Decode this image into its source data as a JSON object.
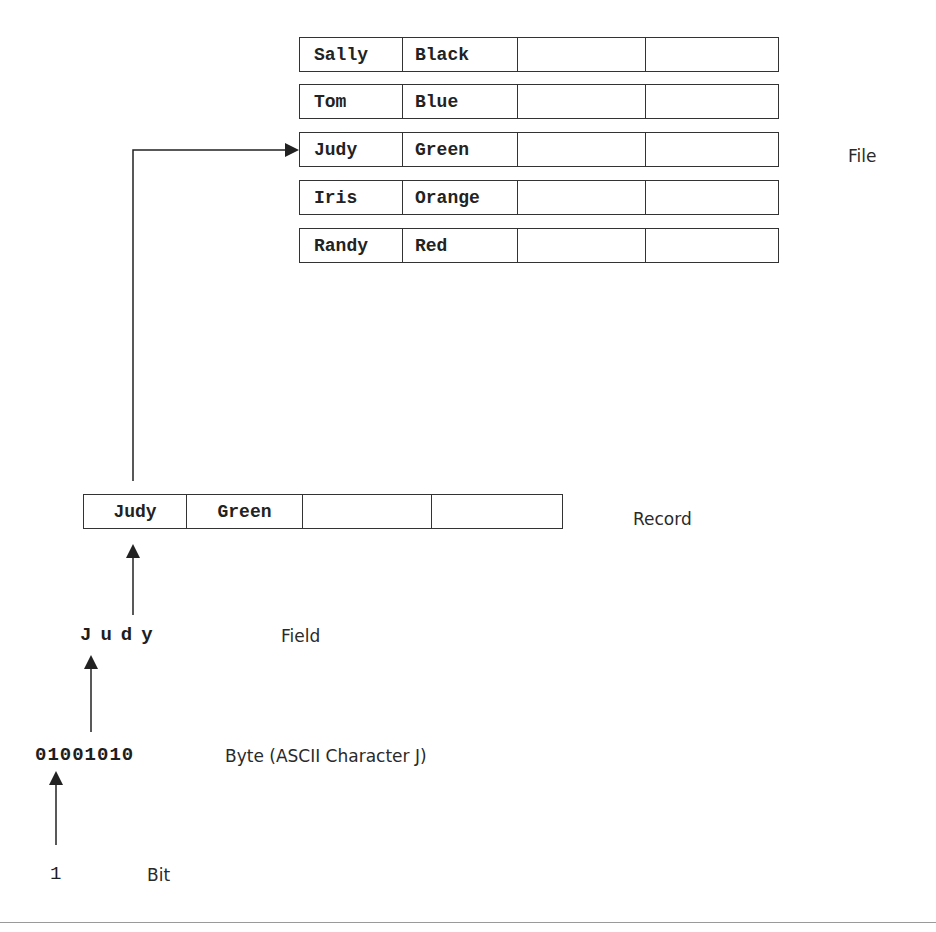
{
  "diagram": {
    "levels": {
      "file": {
        "label": "File",
        "records": [
          {
            "name": "Sally",
            "color": "Black"
          },
          {
            "name": "Tom",
            "color": "Blue"
          },
          {
            "name": "Judy",
            "color": "Green"
          },
          {
            "name": "Iris",
            "color": "Orange"
          },
          {
            "name": "Randy",
            "color": "Red"
          }
        ]
      },
      "record": {
        "label": "Record",
        "fields": [
          "Judy",
          "Green",
          "",
          ""
        ]
      },
      "field": {
        "label": "Field",
        "value": "Judy"
      },
      "byte": {
        "label": "Byte (ASCII Character J)",
        "value": "01001010"
      },
      "bit": {
        "label": "Bit",
        "value": "1"
      }
    },
    "colors": {
      "line": "#222222",
      "text": "#1e1e1e",
      "border": "#333333",
      "rule": "#9a9a9a"
    }
  }
}
